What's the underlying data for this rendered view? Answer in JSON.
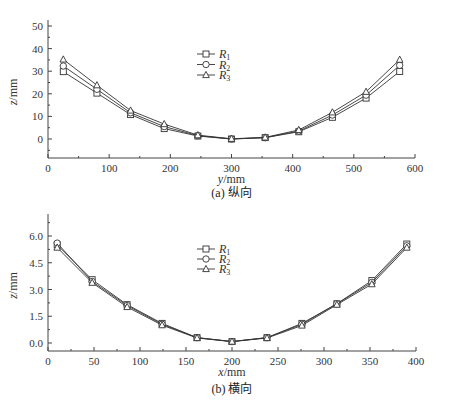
{
  "chart_data": [
    {
      "type": "line",
      "panel": "a",
      "title": "",
      "caption": "(a) 纵向",
      "xlabel": "y/mm",
      "ylabel": "z/mm",
      "xlim": [
        0,
        600
      ],
      "ylim": [
        -8,
        50
      ],
      "xticks": [
        0,
        100,
        200,
        300,
        400,
        500,
        600
      ],
      "yticks": [
        0,
        10,
        20,
        30,
        40,
        50
      ],
      "grid": false,
      "legend_position": "upper center",
      "x": [
        25,
        80,
        135,
        190,
        245,
        300,
        355,
        410,
        465,
        520,
        575
      ],
      "series": [
        {
          "name": "R1",
          "label_base": "R",
          "label_sub": "1",
          "marker": "square",
          "values": [
            29.8,
            20.3,
            10.8,
            4.6,
            1.3,
            0.0,
            0.6,
            3.2,
            9.6,
            18.1,
            29.9
          ]
        },
        {
          "name": "R2",
          "label_base": "R",
          "label_sub": "2",
          "marker": "circle",
          "values": [
            32.3,
            22.0,
            11.6,
            5.5,
            1.5,
            0.0,
            0.6,
            3.5,
            10.6,
            19.4,
            32.6
          ]
        },
        {
          "name": "R3",
          "label_base": "R",
          "label_sub": "3",
          "marker": "triangle",
          "values": [
            35.2,
            23.8,
            12.6,
            6.6,
            1.7,
            0.1,
            0.7,
            4.0,
            11.8,
            20.9,
            35.1
          ]
        }
      ]
    },
    {
      "type": "line",
      "panel": "b",
      "title": "",
      "caption": "(b) 横向",
      "xlabel": "x/mm",
      "ylabel": "z/mm",
      "xlim": [
        0,
        400
      ],
      "ylim": [
        -0.45,
        6.9
      ],
      "xticks": [
        0,
        50,
        100,
        150,
        200,
        250,
        300,
        350,
        400
      ],
      "yticks": [
        "0.0",
        "1.5",
        "3.0",
        "4.5",
        "6.0"
      ],
      "grid": false,
      "legend_position": "upper center",
      "x": [
        10,
        48,
        86,
        124,
        162,
        200,
        238,
        276,
        314,
        352,
        390
      ],
      "series": [
        {
          "name": "R1",
          "label_base": "R",
          "label_sub": "1",
          "marker": "square",
          "values": [
            5.5,
            3.55,
            2.15,
            1.1,
            0.3,
            0.08,
            0.3,
            1.1,
            2.2,
            3.5,
            5.55
          ]
        },
        {
          "name": "R2",
          "label_base": "R",
          "label_sub": "2",
          "marker": "circle",
          "values": [
            5.6,
            3.45,
            2.1,
            1.05,
            0.3,
            0.08,
            0.3,
            1.05,
            2.2,
            3.4,
            5.45
          ]
        },
        {
          "name": "R3",
          "label_base": "R",
          "label_sub": "3",
          "marker": "triangle",
          "values": [
            5.35,
            3.38,
            2.02,
            1.0,
            0.28,
            0.08,
            0.28,
            0.98,
            2.15,
            3.3,
            5.35
          ]
        }
      ]
    }
  ],
  "colors": {
    "line": "#333333",
    "marker_fill": "#ffffff",
    "axis": "#444444"
  }
}
